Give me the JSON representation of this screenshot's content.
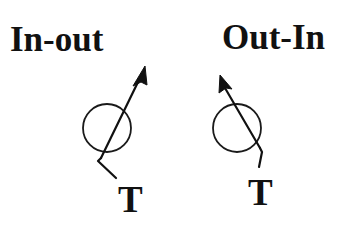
{
  "diagram": {
    "panels": [
      {
        "id": "in-out",
        "title": "In-out",
        "terminal_label": "T",
        "arrow_direction": "up-right"
      },
      {
        "id": "out-in",
        "title": "Out-In",
        "terminal_label": "T",
        "arrow_direction": "up-left"
      }
    ],
    "colors": {
      "ink": "#111111",
      "background": "#ffffff"
    }
  }
}
